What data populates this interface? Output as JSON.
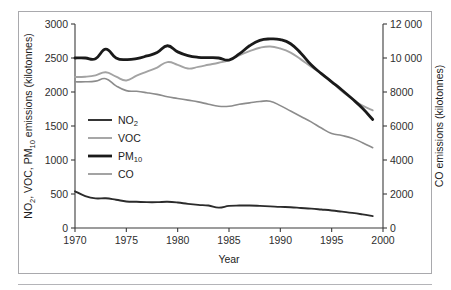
{
  "figure": {
    "frame_border_color": "#a9a9ad",
    "background": "#ffffff"
  },
  "axes": {
    "x": {
      "title": "Year",
      "ticks": [
        "1970",
        "1975",
        "1980",
        "1985",
        "1990",
        "1995",
        "2000"
      ],
      "min": 1970,
      "max": 2000
    },
    "y_left": {
      "title_parts": [
        "NO",
        "2",
        ", VOC, PM",
        "10",
        " emissions (kilotonnes)"
      ],
      "title": "NO2, VOC, PM10 emissions (kilotonnes)",
      "ticks": [
        "0",
        "500",
        "1000",
        "1500",
        "2000",
        "2500",
        "3000"
      ],
      "min": 0,
      "max": 3000
    },
    "y_right": {
      "title": "CO emissions (kilotonnes)",
      "ticks": [
        "0",
        "2000",
        "4000",
        "6000",
        "8000",
        "10 000",
        "12 000"
      ],
      "min": 0,
      "max": 12000
    }
  },
  "legend": {
    "items": [
      {
        "label_parts": [
          "NO",
          "2",
          ""
        ],
        "label": "NO2",
        "color": "#2b2b2b",
        "width": 1.9
      },
      {
        "label_parts": [
          "VOC",
          "",
          ""
        ],
        "label": "VOC",
        "color": "#a3a3a3",
        "width": 1.9
      },
      {
        "label_parts": [
          "PM",
          "10",
          ""
        ],
        "label": "PM10",
        "color": "#1a1a1a",
        "width": 2.8
      },
      {
        "label_parts": [
          "CO",
          "",
          ""
        ],
        "label": "CO",
        "color": "#8c8c8c",
        "width": 1.6
      }
    ]
  },
  "chart_data": {
    "type": "line",
    "title": "",
    "xlabel": "Year",
    "ylabel": "NO2, VOC, PM10 emissions (kilotonnes)",
    "ylabel_right": "CO emissions (kilotonnes)",
    "xlim": [
      1970,
      2000
    ],
    "ylim": [
      0,
      3000
    ],
    "ylim_right": [
      0,
      12000
    ],
    "grid": false,
    "legend_position": "center-left",
    "x": [
      1970,
      1971,
      1972,
      1973,
      1974,
      1975,
      1976,
      1977,
      1978,
      1979,
      1980,
      1981,
      1982,
      1983,
      1984,
      1985,
      1986,
      1987,
      1988,
      1989,
      1990,
      1991,
      1992,
      1993,
      1994,
      1995,
      1996,
      1997,
      1998,
      1999
    ],
    "series": [
      {
        "name": "NO2",
        "axis": "left",
        "units": "kilotonnes",
        "color": "#2b2b2b",
        "values": [
          540,
          470,
          435,
          437,
          415,
          390,
          385,
          380,
          380,
          385,
          375,
          355,
          340,
          330,
          300,
          325,
          330,
          330,
          325,
          318,
          310,
          305,
          295,
          285,
          272,
          258,
          240,
          222,
          200,
          175
        ]
      },
      {
        "name": "VOC",
        "axis": "left",
        "units": "kilotonnes",
        "color": "#a3a3a3",
        "values": [
          2220,
          2225,
          2245,
          2290,
          2225,
          2170,
          2240,
          2300,
          2360,
          2440,
          2400,
          2345,
          2370,
          2400,
          2430,
          2470,
          2540,
          2600,
          2650,
          2670,
          2640,
          2580,
          2480,
          2370,
          2270,
          2150,
          2010,
          1900,
          1800,
          1730
        ]
      },
      {
        "name": "PM10",
        "axis": "left",
        "units": "kilotonnes",
        "color": "#1a1a1a",
        "values": [
          2500,
          2500,
          2490,
          2630,
          2500,
          2475,
          2490,
          2530,
          2580,
          2680,
          2590,
          2535,
          2510,
          2505,
          2500,
          2470,
          2560,
          2680,
          2760,
          2780,
          2770,
          2710,
          2570,
          2400,
          2270,
          2150,
          2030,
          1900,
          1760,
          1595
        ]
      },
      {
        "name": "CO",
        "axis": "right",
        "units": "kilotonnes",
        "color": "#8c8c8c",
        "values_left_scale": [
          2150,
          2150,
          2160,
          2195,
          2090,
          2020,
          2010,
          1990,
          1965,
          1930,
          1905,
          1880,
          1855,
          1820,
          1790,
          1790,
          1820,
          1840,
          1860,
          1865,
          1800,
          1720,
          1640,
          1560,
          1470,
          1390,
          1360,
          1320,
          1255,
          1180
        ],
        "values": [
          8600,
          8600,
          8640,
          8780,
          8360,
          8080,
          8040,
          7960,
          7860,
          7720,
          7620,
          7520,
          7420,
          7280,
          7160,
          7160,
          7280,
          7360,
          7440,
          7460,
          7200,
          6880,
          6560,
          6240,
          5880,
          5560,
          5440,
          5280,
          5020,
          4720
        ]
      }
    ]
  }
}
